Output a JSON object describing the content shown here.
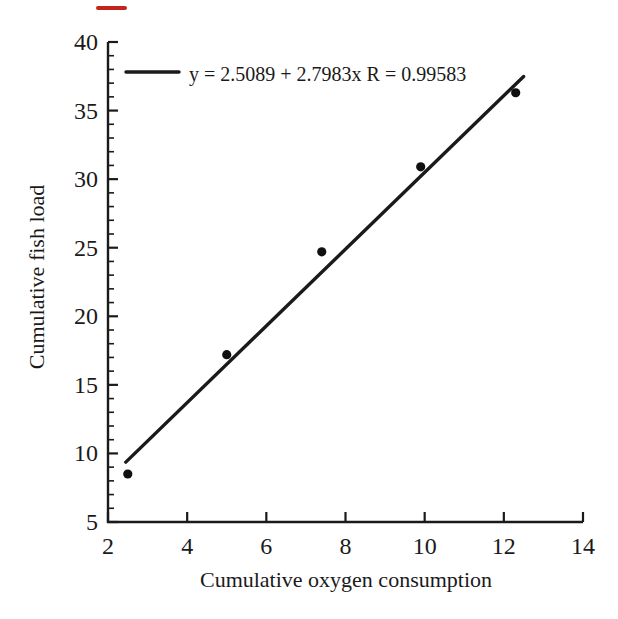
{
  "figure": {
    "background_color": "#ffffff",
    "ink_color": "#1a1a1a",
    "point_color": "#101010",
    "red_mark_color": "#c0261b"
  },
  "chart_data": {
    "type": "scatter",
    "title": "",
    "xlabel": "Cumulative oxygen consumption",
    "ylabel": "Cumulative fish load",
    "xlim": [
      2,
      14
    ],
    "ylim": [
      5,
      40
    ],
    "x_major_ticks": [
      2,
      4,
      6,
      8,
      10,
      12,
      14
    ],
    "y_major_ticks": [
      5,
      10,
      15,
      20,
      25,
      30,
      35,
      40
    ],
    "y_minor_tick_step": 1,
    "grid": false,
    "legend": {
      "label": "y = 2.5089 + 2.7983x R = 0.99583",
      "position": "top-inside"
    },
    "series": [
      {
        "name": "observations",
        "type": "scatter",
        "marker": "filled-circle",
        "points": [
          [
            2.5,
            8.5
          ],
          [
            5.0,
            17.2
          ],
          [
            7.4,
            24.7
          ],
          [
            9.9,
            30.9
          ],
          [
            12.3,
            36.3
          ]
        ]
      },
      {
        "name": "linear-fit",
        "type": "line",
        "equation": {
          "intercept": 2.5089,
          "slope": 2.7983,
          "R": 0.99583
        },
        "x_range": [
          2.45,
          12.5
        ]
      }
    ]
  }
}
